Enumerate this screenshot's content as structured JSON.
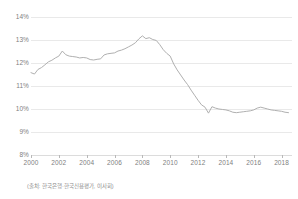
{
  "chart_data": {
    "type": "line",
    "title": "",
    "subtitle": "",
    "xlabel": "",
    "ylabel": "",
    "ylim": [
      8,
      14
    ],
    "xlim": [
      2000,
      2018.75
    ],
    "grid": true,
    "legend": null,
    "y_tick_labels": [
      "14%",
      "13%",
      "12%",
      "11%",
      "10%",
      "9%",
      "8%"
    ],
    "y_ticks": [
      14,
      13,
      12,
      11,
      10,
      9,
      8
    ],
    "x_tick_labels": [
      "2000",
      "2002",
      "2004",
      "2006",
      "2008",
      "2010",
      "2012",
      "2014",
      "2016",
      "2018"
    ],
    "x_ticks": [
      2000,
      2002,
      2004,
      2006,
      2008,
      2010,
      2012,
      2014,
      2016,
      2018
    ],
    "series": [
      {
        "name": "",
        "color": "#b0b0b0",
        "x": [
          2000.0,
          2000.25,
          2000.5,
          2000.75,
          2001.0,
          2001.25,
          2001.5,
          2001.75,
          2002.0,
          2002.25,
          2002.5,
          2002.75,
          2003.0,
          2003.25,
          2003.5,
          2003.75,
          2004.0,
          2004.25,
          2004.5,
          2004.75,
          2005.0,
          2005.25,
          2005.5,
          2005.75,
          2006.0,
          2006.25,
          2006.5,
          2006.75,
          2007.0,
          2007.25,
          2007.5,
          2007.75,
          2008.0,
          2008.25,
          2008.5,
          2008.75,
          2009.0,
          2009.25,
          2009.5,
          2009.75,
          2010.0,
          2010.25,
          2010.5,
          2010.75,
          2011.0,
          2011.25,
          2011.5,
          2011.75,
          2012.0,
          2012.25,
          2012.5,
          2012.75,
          2013.0,
          2013.25,
          2013.5,
          2013.75,
          2014.0,
          2014.25,
          2014.5,
          2014.75,
          2015.0,
          2015.25,
          2015.5,
          2015.75,
          2016.0,
          2016.25,
          2016.5,
          2016.75,
          2017.0,
          2017.25,
          2017.5,
          2017.75,
          2018.0,
          2018.25,
          2018.5
        ],
        "values": [
          11.58,
          11.52,
          11.72,
          11.8,
          11.92,
          12.05,
          12.12,
          12.22,
          12.3,
          12.52,
          12.36,
          12.3,
          12.28,
          12.26,
          12.22,
          12.24,
          12.22,
          12.15,
          12.13,
          12.16,
          12.18,
          12.35,
          12.4,
          12.42,
          12.44,
          12.52,
          12.56,
          12.62,
          12.7,
          12.78,
          12.88,
          13.05,
          13.18,
          13.06,
          13.1,
          13.02,
          12.98,
          12.8,
          12.58,
          12.42,
          12.3,
          11.96,
          11.7,
          11.48,
          11.26,
          11.06,
          10.82,
          10.6,
          10.38,
          10.18,
          10.08,
          9.82,
          10.1,
          10.04,
          10.0,
          9.98,
          9.96,
          9.92,
          9.86,
          9.84,
          9.86,
          9.88,
          9.9,
          9.92,
          9.96,
          10.04,
          10.08,
          10.04,
          10.0,
          9.96,
          9.94,
          9.92,
          9.9,
          9.86,
          9.84
        ]
      }
    ]
  },
  "source": {
    "note": "(출처: 한국은행·한국신용평가, 이사회)"
  }
}
